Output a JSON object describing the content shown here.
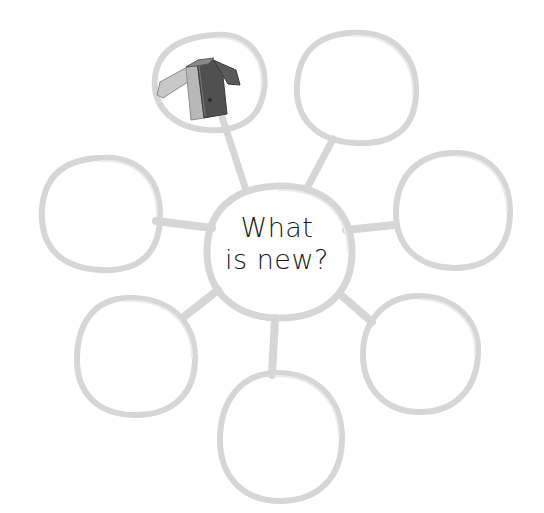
{
  "diagram": {
    "type": "bubble-web",
    "center": {
      "line1": "What",
      "line2": "is new?"
    },
    "colors": {
      "outline": "#d4d4d4",
      "outline_light": "#e4e4e4",
      "text": "#1a1a1a",
      "jacket_dark": "#4a4a4a",
      "jacket_light": "#b8b8b8"
    },
    "bubbles": [
      {
        "position": "top-left",
        "content": "jacket-drawing"
      },
      {
        "position": "top-right",
        "content": ""
      },
      {
        "position": "left",
        "content": ""
      },
      {
        "position": "right",
        "content": ""
      },
      {
        "position": "bottom-left",
        "content": ""
      },
      {
        "position": "bottom-right",
        "content": ""
      },
      {
        "position": "bottom",
        "content": ""
      }
    ]
  }
}
